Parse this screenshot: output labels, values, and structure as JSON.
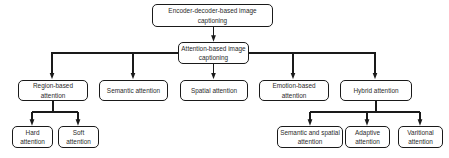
{
  "diagram": {
    "type": "tree-hierarchy-flowchart",
    "orientation": "top-down",
    "style": {
      "box_fill": "#ffffff",
      "box_border": "#1a1a1a",
      "text_color": "#2b2b2b",
      "connector_color": "#1a1a1a",
      "background": "#ffffff",
      "corner": "rounded"
    },
    "levels": {
      "root": {
        "id": "encoder-decoder-based-image-captioning",
        "label": "Encoder-decoder-based image captioning"
      },
      "level1": {
        "id": "attention-based-image-captioning",
        "label": "Attention-based image captioning"
      },
      "level2": [
        {
          "id": "region-based-attention",
          "label": "Region-based attention"
        },
        {
          "id": "semantic-attention",
          "label": "Semantic attention"
        },
        {
          "id": "spatial-attention",
          "label": "Spatial attention"
        },
        {
          "id": "emotion-based-attention",
          "label": "Emotion-based attention"
        },
        {
          "id": "hybrid-attention",
          "label": "Hybrid attention"
        }
      ],
      "level3_region": [
        {
          "id": "hard-attention",
          "label": "Hard attention"
        },
        {
          "id": "soft-attention",
          "label": "Soft attention"
        }
      ],
      "level3_hybrid": [
        {
          "id": "semantic-and-spatial-attention",
          "label": "Semantic and spatial attention"
        },
        {
          "id": "adaptive-attention",
          "label": "Adaptive attention"
        },
        {
          "id": "varitional-attention",
          "label": "Varitional attention"
        }
      ]
    },
    "edges": [
      {
        "from": "encoder-decoder-based-image-captioning",
        "to": "attention-based-image-captioning",
        "arrow": true
      },
      {
        "from": "attention-based-image-captioning",
        "to": "region-based-attention",
        "arrow": true
      },
      {
        "from": "attention-based-image-captioning",
        "to": "semantic-attention",
        "arrow": true
      },
      {
        "from": "attention-based-image-captioning",
        "to": "spatial-attention",
        "arrow": true
      },
      {
        "from": "attention-based-image-captioning",
        "to": "emotion-based-attention",
        "arrow": true
      },
      {
        "from": "attention-based-image-captioning",
        "to": "hybrid-attention",
        "arrow": true
      },
      {
        "from": "region-based-attention",
        "to": "hard-attention",
        "arrow": true
      },
      {
        "from": "region-based-attention",
        "to": "soft-attention",
        "arrow": true
      },
      {
        "from": "hybrid-attention",
        "to": "semantic-and-spatial-attention",
        "arrow": true
      },
      {
        "from": "hybrid-attention",
        "to": "adaptive-attention",
        "arrow": true
      },
      {
        "from": "hybrid-attention",
        "to": "varitional-attention",
        "arrow": true
      }
    ]
  }
}
